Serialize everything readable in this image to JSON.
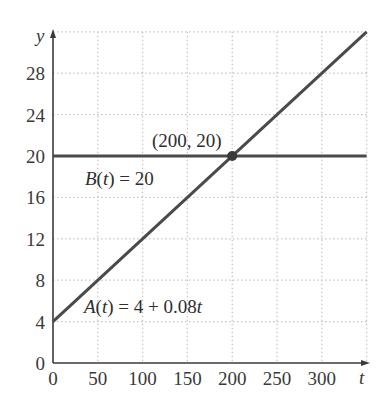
{
  "chart_data": {
    "type": "line",
    "title": "",
    "xlabel": "t",
    "ylabel": "y",
    "xlim": [
      0,
      350
    ],
    "ylim": [
      0,
      32
    ],
    "grid": true,
    "x_ticks": [
      "0",
      "50",
      "100",
      "150",
      "200",
      "250",
      "300"
    ],
    "y_ticks": [
      "0",
      "4",
      "8",
      "12",
      "16",
      "20",
      "24",
      "28"
    ],
    "series": [
      {
        "name": "A(t) = 4 + 0.08t",
        "x": [
          0,
          50,
          100,
          150,
          200,
          250,
          300,
          350
        ],
        "values": [
          4,
          8,
          12,
          16,
          20,
          24,
          28,
          32
        ]
      },
      {
        "name": "B(t) = 20",
        "x": [
          0,
          350
        ],
        "values": [
          20,
          20
        ]
      }
    ],
    "annotations": [
      {
        "text": "(200, 20)",
        "x": 200,
        "y": 20,
        "type": "intersection-point"
      }
    ],
    "colors": {
      "line": "#4a4a4a",
      "grid": "#c4c4c4",
      "axis": "#3a3a3a",
      "point": "#3a3a3a"
    }
  },
  "labels": {
    "y_axis": "y",
    "x_axis": "t",
    "point": "(200, 20)",
    "b_name": "B",
    "b_arg": "t",
    "b_rhs": " = 20",
    "a_name": "A",
    "a_arg": "t",
    "a_rhs_const": " = 4 + 0.08",
    "a_rhs_var": "t"
  }
}
